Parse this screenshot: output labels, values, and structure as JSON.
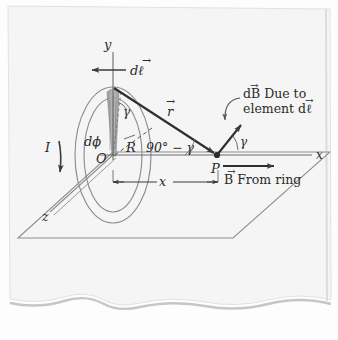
{
  "figure": {
    "kind": "hand-drawn-physics-diagram",
    "media": {
      "paper_color": "#f4f4f4",
      "paper_edge_color": "#c9c9c9",
      "ink_color": "#3a3a3a",
      "light_ink_color": "#8d8d8d",
      "shade_color": "#9a9a9a"
    }
  },
  "axes": {
    "y_label": "y",
    "x_label": "x",
    "z_label": "z",
    "origin_label": "O"
  },
  "labels": {
    "current": "I",
    "element_vector": "d",
    "element_vector_symbol": "ℓ",
    "element_full": "dℓ",
    "radius": "R",
    "angle_dphi": "dϕ",
    "angle_gamma_ring": "γ",
    "angle_gamma_field": "γ",
    "angle_complement": "90° − γ",
    "r_vector": "r",
    "point_p": "P",
    "distance_x": "x",
    "db_caption_line1": "dB Due to",
    "db_caption_line2": "element dℓ",
    "b_caption": "B From ring"
  },
  "vector_arrow_hats": {
    "dl": "→",
    "r": "→",
    "dB": "→",
    "B": "→"
  },
  "geometry": {
    "plane_corners": [
      [
        18,
        238
      ],
      [
        113,
        152
      ],
      [
        330,
        152
      ],
      [
        233,
        238
      ]
    ],
    "ring_center": [
      113,
      155
    ],
    "ring_outer_rx": 38,
    "ring_outer_ry": 68,
    "ring_inner_rx": 29,
    "ring_inner_ry": 57,
    "point_p": [
      217,
      155
    ],
    "dl_point": [
      113,
      88
    ],
    "y_axis_top": [
      113,
      52
    ],
    "x_axis_right": [
      312,
      155
    ],
    "z_axis_end": [
      52,
      212
    ]
  }
}
